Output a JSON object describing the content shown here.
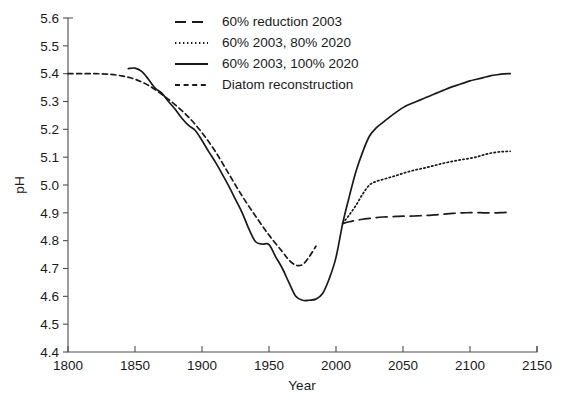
{
  "chart_data": {
    "type": "line",
    "title": "",
    "xlabel": "Year",
    "ylabel": "pH",
    "xlim": [
      1800,
      2150
    ],
    "ylim": [
      4.4,
      5.6
    ],
    "xticks": [
      1800,
      1850,
      1900,
      1950,
      2000,
      2050,
      2100,
      2150
    ],
    "yticks": [
      4.4,
      4.5,
      4.6,
      4.7,
      4.8,
      4.9,
      5.0,
      5.1,
      5.2,
      5.3,
      5.4,
      5.5,
      5.6
    ],
    "grid": false,
    "legend_position": "top-center",
    "line_color": "#1a1a1a",
    "series": [
      {
        "name": "60% reduction 2003",
        "style": "long-dash",
        "x": [
          2005,
          2010,
          2015,
          2020,
          2025,
          2030,
          2035,
          2040,
          2045,
          2050,
          2055,
          2060,
          2065,
          2070,
          2075,
          2080,
          2085,
          2090,
          2095,
          2100,
          2105,
          2110,
          2115,
          2120,
          2125,
          2130
        ],
        "values": [
          4.862,
          4.868,
          4.873,
          4.877,
          4.88,
          4.883,
          4.885,
          4.886,
          4.887,
          4.888,
          4.888,
          4.889,
          4.89,
          4.891,
          4.893,
          4.895,
          4.897,
          4.899,
          4.9,
          4.901,
          4.901,
          4.9,
          4.9,
          4.9,
          4.901,
          4.902
        ]
      },
      {
        "name": "60% 2003, 80% 2020",
        "style": "dotted",
        "x": [
          2005,
          2010,
          2015,
          2020,
          2025,
          2030,
          2035,
          2040,
          2045,
          2050,
          2055,
          2060,
          2065,
          2070,
          2075,
          2080,
          2085,
          2090,
          2095,
          2100,
          2105,
          2110,
          2115,
          2120,
          2125,
          2130
        ],
        "values": [
          4.862,
          4.893,
          4.928,
          4.968,
          5.0,
          5.013,
          5.02,
          5.027,
          5.034,
          5.042,
          5.049,
          5.055,
          5.06,
          5.066,
          5.072,
          5.078,
          5.083,
          5.088,
          5.092,
          5.096,
          5.101,
          5.108,
          5.114,
          5.118,
          5.12,
          5.121
        ]
      },
      {
        "name": "60% 2003, 100% 2020",
        "style": "solid",
        "x": [
          1845,
          1850,
          1855,
          1860,
          1865,
          1870,
          1875,
          1880,
          1885,
          1890,
          1895,
          1900,
          1905,
          1910,
          1915,
          1920,
          1925,
          1930,
          1935,
          1940,
          1945,
          1950,
          1955,
          1960,
          1965,
          1970,
          1975,
          1980,
          1985,
          1990,
          1995,
          2000,
          2005,
          2010,
          2015,
          2020,
          2025,
          2030,
          2035,
          2040,
          2045,
          2050,
          2055,
          2060,
          2065,
          2070,
          2075,
          2080,
          2085,
          2090,
          2095,
          2100,
          2105,
          2110,
          2115,
          2120,
          2125,
          2130
        ],
        "values": [
          5.418,
          5.42,
          5.408,
          5.38,
          5.348,
          5.33,
          5.3,
          5.272,
          5.24,
          5.214,
          5.196,
          5.16,
          5.12,
          5.082,
          5.04,
          4.996,
          4.948,
          4.9,
          4.842,
          4.796,
          4.788,
          4.786,
          4.742,
          4.7,
          4.648,
          4.6,
          4.586,
          4.586,
          4.59,
          4.61,
          4.664,
          4.74,
          4.862,
          4.96,
          5.05,
          5.12,
          5.176,
          5.205,
          5.225,
          5.244,
          5.262,
          5.278,
          5.29,
          5.3,
          5.31,
          5.32,
          5.33,
          5.34,
          5.35,
          5.358,
          5.366,
          5.374,
          5.38,
          5.386,
          5.392,
          5.396,
          5.399,
          5.4
        ]
      },
      {
        "name": "Diatom reconstruction",
        "style": "short-dash",
        "x": [
          1800,
          1810,
          1820,
          1830,
          1840,
          1850,
          1860,
          1870,
          1880,
          1890,
          1900,
          1910,
          1920,
          1930,
          1940,
          1950,
          1960,
          1965,
          1970,
          1975,
          1980,
          1985
        ],
        "values": [
          5.4,
          5.4,
          5.4,
          5.398,
          5.392,
          5.38,
          5.358,
          5.326,
          5.288,
          5.244,
          5.188,
          5.12,
          5.04,
          4.96,
          4.888,
          4.82,
          4.76,
          4.73,
          4.712,
          4.714,
          4.742,
          4.78
        ]
      }
    ]
  },
  "legend": {
    "items": [
      {
        "label": "60% reduction 2003",
        "style": "long-dash"
      },
      {
        "label": "60% 2003, 80% 2020",
        "style": "dotted"
      },
      {
        "label": "60% 2003, 100% 2020",
        "style": "solid"
      },
      {
        "label": "Diatom reconstruction",
        "style": "short-dash"
      }
    ]
  },
  "axes": {
    "x_title": "Year",
    "y_title": "pH",
    "x_tick_labels": [
      "1800",
      "1850",
      "1900",
      "1950",
      "2000",
      "2050",
      "2100",
      "2150"
    ],
    "y_tick_labels": [
      "5.6",
      "5.5",
      "5.4",
      "5.3",
      "5.2",
      "5.1",
      "5.0",
      "4.9",
      "4.8",
      "4.7",
      "4.6",
      "4.5",
      "4.4"
    ]
  }
}
